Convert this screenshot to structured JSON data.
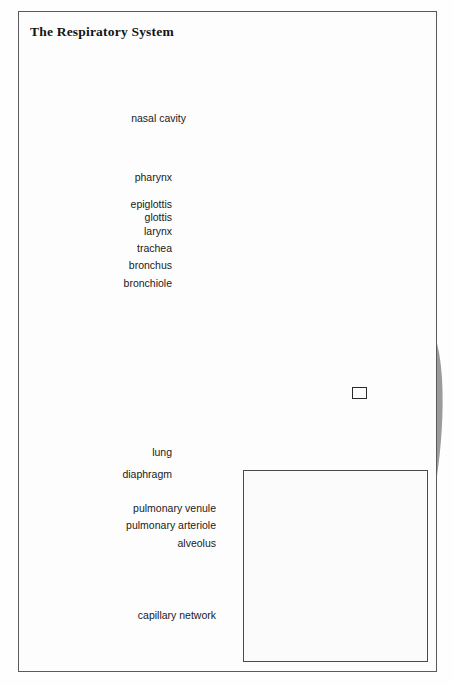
{
  "figure": {
    "title": "The Respiratory System",
    "style": "grayscale airbrush medical illustration",
    "frame_color": "#5a5a5a",
    "label_color": "#1a1a1a",
    "leader_color": "#1c1c1c"
  },
  "labels": [
    {
      "id": "nasal-cavity",
      "text": "nasal cavity",
      "x": 186,
      "y": 118,
      "leader": [
        [
          190,
          118
        ],
        [
          249,
          131
        ]
      ]
    },
    {
      "id": "pharynx",
      "text": "pharynx",
      "x": 172,
      "y": 177,
      "leader": [
        [
          176,
          177
        ],
        [
          281,
          172
        ]
      ]
    },
    {
      "id": "epiglottis",
      "text": "epiglottis",
      "x": 172,
      "y": 204,
      "leader": [
        [
          176,
          204
        ],
        [
          291,
          191
        ]
      ]
    },
    {
      "id": "glottis",
      "text": "glottis",
      "x": 172,
      "y": 217,
      "leader": [
        [
          176,
          217
        ],
        [
          296,
          199
        ]
      ]
    },
    {
      "id": "larynx",
      "text": "larynx",
      "x": 172,
      "y": 231,
      "leader": [
        [
          176,
          231
        ],
        [
          299,
          209
        ]
      ]
    },
    {
      "id": "trachea",
      "text": "trachea",
      "x": 172,
      "y": 248,
      "leader": [
        [
          176,
          248
        ],
        [
          303,
          247
        ]
      ]
    },
    {
      "id": "bronchus",
      "text": "bronchus",
      "x": 172,
      "y": 265,
      "leader": [
        [
          176,
          265
        ],
        [
          296,
          300
        ]
      ]
    },
    {
      "id": "bronchiole",
      "text": "bronchiole",
      "x": 172,
      "y": 283,
      "leader": [
        [
          176,
          283
        ],
        [
          262,
          306
        ]
      ]
    },
    {
      "id": "lung",
      "text": "lung",
      "x": 172,
      "y": 452,
      "leader": [
        [
          176,
          452
        ],
        [
          229,
          434
        ]
      ]
    },
    {
      "id": "diaphragm",
      "text": "diaphragm",
      "x": 172,
      "y": 474,
      "leader": [
        [
          176,
          474
        ],
        [
          305,
          468
        ]
      ]
    },
    {
      "id": "pulmonary-venule",
      "text": "pulmonary venule",
      "x": 216,
      "y": 508,
      "leader": [
        [
          218,
          508
        ],
        [
          300,
          513
        ]
      ]
    },
    {
      "id": "pulmonary-arteriole",
      "text": "pulmonary arteriole",
      "x": 216,
      "y": 525,
      "leader": [
        [
          218,
          525
        ],
        [
          300,
          527
        ]
      ]
    },
    {
      "id": "alveolus",
      "text": "alveolus",
      "x": 216,
      "y": 543,
      "leader": [
        [
          218,
          543
        ],
        [
          370,
          545
        ]
      ]
    },
    {
      "id": "capillary-network",
      "text": "capillary network",
      "x": 216,
      "y": 615,
      "leader": [
        [
          218,
          615
        ],
        [
          304,
          615
        ]
      ]
    }
  ],
  "callout": {
    "name": "magnification-callout",
    "source_box": {
      "x": 352,
      "y": 387,
      "w": 15,
      "h": 12
    },
    "arrow_description": "white tapered arrow from lung detail box down-left to the inset panel"
  },
  "inset": {
    "name": "alveoli-detail-inset",
    "x": 243,
    "y": 470,
    "w": 185,
    "h": 192,
    "contents": "enlarged bronchiole branching into alveolar sacs with surrounding capillary network, pulmonary arteriole and venule"
  },
  "figure_elements": [
    {
      "name": "cigarette-with-smoke",
      "description": "lit cigarette held in left hand with rising smoke trail"
    },
    {
      "name": "head-profile-cutaway",
      "description": "head in left profile with headband, sagittal cutaway of nasal cavity, pharynx, epiglottis, glottis and larynx"
    },
    {
      "name": "trachea",
      "description": "ringed cartilage windpipe descending from larynx"
    },
    {
      "name": "left-lung",
      "description": "lung with visible bronchial tree"
    },
    {
      "name": "right-lung",
      "description": "lung with visible bronchial tree"
    },
    {
      "name": "diaphragm",
      "description": "dome shaped muscle sheet beneath the lungs"
    }
  ]
}
